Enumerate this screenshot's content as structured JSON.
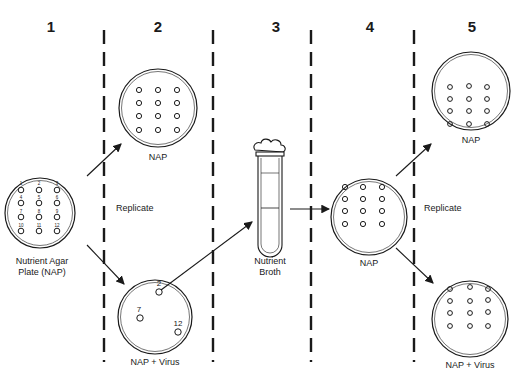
{
  "steps": [
    {
      "number": "1",
      "x": 51
    },
    {
      "number": "2",
      "x": 158
    },
    {
      "number": "3",
      "x": 276
    },
    {
      "number": "4",
      "x": 369
    },
    {
      "number": "5",
      "x": 472
    }
  ],
  "labels": {
    "master_plate": "Nutrient Agar",
    "master_plate_line2": "Plate (NAP)",
    "replicate_left": "Replicate",
    "replicate_right": "Replicate",
    "nap_top_step2": "NAP",
    "nap_virus_step2": "NAP + Virus",
    "broth": "Nutrient",
    "broth_line2": "Broth",
    "nap_step4": "NAP",
    "nap_top_step5": "NAP",
    "nap_virus_step5": "NAP + Virus"
  },
  "master_colonies": [
    "1",
    "2",
    "3",
    "4",
    "5",
    "6",
    "7",
    "8",
    "9",
    "10",
    "11",
    "12"
  ],
  "virus_plate_colonies": [
    "2",
    "7",
    "12"
  ],
  "colors": {
    "line": "#1a1a1a",
    "background": "#ffffff"
  }
}
